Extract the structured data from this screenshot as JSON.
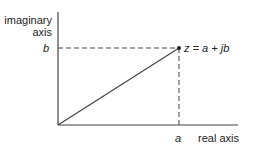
{
  "diagram": {
    "vertical_axis_label_line1": "imaginary",
    "vertical_axis_label_line2": "axis",
    "horizontal_axis_label": "real axis",
    "tick_b": "b",
    "tick_a": "a",
    "point_label": "z = a + jb",
    "colors": {
      "line": "#444444",
      "text": "#222222",
      "background": "#ffffff"
    }
  }
}
